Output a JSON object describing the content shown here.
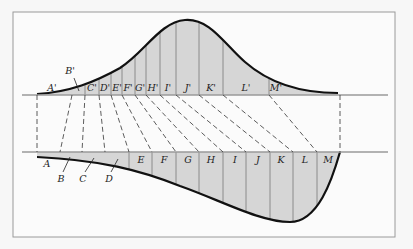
{
  "figure": {
    "frame": {
      "x": 13,
      "y": 12,
      "w": 382,
      "h": 225
    },
    "colors": {
      "background": "#f7f7f7",
      "frame": "#9a9a9a",
      "axis": "#9a9a9a",
      "fill": "#d6d6d6",
      "curve": "#111111",
      "dashed": "#333333",
      "divider": "#7a7a7a"
    },
    "top_axis_y": 95,
    "bottom_axis_y": 152,
    "axis_x_start": 22,
    "axis_x_end": 388,
    "top_labels": [
      {
        "text": "A'",
        "x": 52,
        "y": 91
      },
      {
        "text": "B'",
        "x": 70,
        "y": 74
      },
      {
        "text": "C'",
        "x": 92,
        "y": 91
      },
      {
        "text": "D'",
        "x": 105,
        "y": 91
      },
      {
        "text": "E'",
        "x": 117,
        "y": 91
      },
      {
        "text": "F'",
        "x": 128,
        "y": 91
      },
      {
        "text": "G'",
        "x": 140,
        "y": 91
      },
      {
        "text": "H'",
        "x": 153,
        "y": 91
      },
      {
        "text": "I'",
        "x": 168,
        "y": 91
      },
      {
        "text": "J'",
        "x": 188,
        "y": 91
      },
      {
        "text": "K'",
        "x": 211,
        "y": 91
      },
      {
        "text": "L'",
        "x": 246,
        "y": 91
      },
      {
        "text": "M'",
        "x": 276,
        "y": 91
      }
    ],
    "bottom_labels": [
      {
        "text": "A",
        "x": 47,
        "y": 167
      },
      {
        "text": "B",
        "x": 61,
        "y": 182
      },
      {
        "text": "C",
        "x": 83,
        "y": 182
      },
      {
        "text": "D",
        "x": 109,
        "y": 182
      },
      {
        "text": "E",
        "x": 141,
        "y": 163
      },
      {
        "text": "F",
        "x": 164,
        "y": 163
      },
      {
        "text": "G",
        "x": 188,
        "y": 163
      },
      {
        "text": "H",
        "x": 211,
        "y": 163
      },
      {
        "text": "I",
        "x": 235,
        "y": 163
      },
      {
        "text": "J",
        "x": 258,
        "y": 163
      },
      {
        "text": "K",
        "x": 281,
        "y": 163
      },
      {
        "text": "L",
        "x": 305,
        "y": 163
      },
      {
        "text": "M",
        "x": 328,
        "y": 163
      }
    ],
    "top_dividers_x": [
      85,
      99,
      111,
      122,
      135,
      146,
      160,
      176,
      199,
      223,
      269
    ],
    "bottom_dividers_x": [
      129,
      152,
      176,
      199,
      223,
      246,
      270,
      293,
      317
    ],
    "dashed_links": [
      [
        37,
        95,
        37,
        152
      ],
      [
        72,
        95,
        60,
        152
      ],
      [
        85,
        95,
        82,
        152
      ],
      [
        99,
        95,
        105,
        152
      ],
      [
        111,
        95,
        129,
        152
      ],
      [
        122,
        95,
        152,
        152
      ],
      [
        135,
        95,
        176,
        152
      ],
      [
        146,
        95,
        199,
        152
      ],
      [
        160,
        95,
        223,
        152
      ],
      [
        176,
        95,
        246,
        152
      ],
      [
        199,
        95,
        270,
        152
      ],
      [
        223,
        95,
        293,
        152
      ],
      [
        269,
        95,
        317,
        152
      ],
      [
        340,
        95,
        340,
        152
      ]
    ],
    "pointer_lines": [
      {
        "from": [
          74,
          78
        ],
        "to": [
          79,
          91
        ]
      },
      {
        "from": [
          63,
          172
        ],
        "to": [
          70,
          157
        ]
      },
      {
        "from": [
          85,
          172
        ],
        "to": [
          94,
          158
        ]
      },
      {
        "from": [
          111,
          172
        ],
        "to": [
          118,
          159
        ]
      }
    ]
  }
}
